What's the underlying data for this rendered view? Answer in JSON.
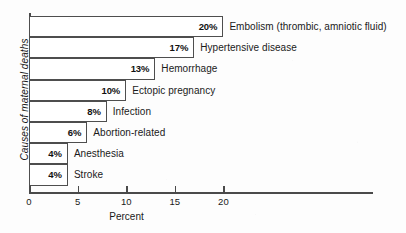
{
  "chart_data": {
    "type": "bar",
    "orientation": "horizontal",
    "title": "",
    "xlabel": "Percent",
    "ylabel": "Causes of maternal deaths",
    "xlim": [
      0,
      24
    ],
    "xticks": [
      0,
      5,
      10,
      15,
      20
    ],
    "xtick_labels": [
      "0",
      "5",
      "10",
      "15",
      "20"
    ],
    "grid": false,
    "legend": "none",
    "categories": [
      "Embolism (thrombic, amniotic fluid)",
      "Hypertensive disease",
      "Hemorrhage",
      "Ectopic pregnancy",
      "Infection",
      "Abortion-related",
      "Anesthesia",
      "Stroke"
    ],
    "values": [
      20,
      17,
      13,
      10,
      8,
      6,
      4,
      4
    ],
    "value_labels": [
      "20%",
      "17%",
      "13%",
      "10%",
      "8%",
      "6%",
      "4%",
      "4%"
    ],
    "bars": [
      {
        "label": "Embolism (thrombic, amniotic fluid)",
        "value": 20,
        "value_label": "20%"
      },
      {
        "label": "Hypertensive disease",
        "value": 17,
        "value_label": "17%"
      },
      {
        "label": "Hemorrhage",
        "value": 13,
        "value_label": "13%"
      },
      {
        "label": "Ectopic pregnancy",
        "value": 10,
        "value_label": "10%"
      },
      {
        "label": "Infection",
        "value": 8,
        "value_label": "8%"
      },
      {
        "label": "Abortion-related",
        "value": 6,
        "value_label": "6%"
      },
      {
        "label": "Anesthesia",
        "value": 4,
        "value_label": "4%"
      },
      {
        "label": "Stroke",
        "value": 4,
        "value_label": "4%"
      }
    ],
    "colors": {
      "bar_fill": "#ffffff",
      "bar_stroke": "#4e4e4e",
      "axis": "#4a4a4a",
      "text": "#1a1a1a",
      "background": "#fdfdfd"
    }
  }
}
